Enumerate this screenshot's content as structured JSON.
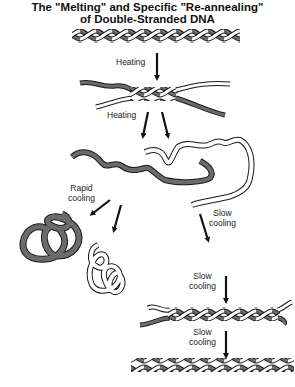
{
  "title": {
    "line1": "The \"Melting\" and Specific \"Re-annealing\"",
    "line2": "of Double-Stranded DNA"
  },
  "colors": {
    "strand_dark": "#6b6b6b",
    "strand_light": "#ffffff",
    "outline": "#1a1a1a",
    "arrow": "#111111"
  },
  "steps": {
    "heating_1": "Heating",
    "heating_2": "Heating",
    "rapid_cooling_1": "Rapid",
    "rapid_cooling_2": "cooling",
    "slow_cooling_a1": "Slow",
    "slow_cooling_a2": "cooling",
    "slow_cooling_b1": "Slow",
    "slow_cooling_b2": "cooling",
    "slow_cooling_c1": "Slow",
    "slow_cooling_c2": "cooling"
  },
  "stages": [
    "double-stranded-dna",
    "partially-melted-dna",
    "separated-single-strands",
    "misfolded-tangles",
    "partially-reannealed-dna",
    "reannealed-double-stranded-dna"
  ]
}
